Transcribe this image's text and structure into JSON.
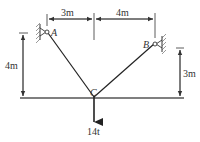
{
  "diagram": {
    "type": "cable-load statics figure",
    "points": {
      "A": {
        "label": "A"
      },
      "B": {
        "label": "B"
      },
      "C": {
        "label": "C"
      }
    },
    "dimensions": {
      "top_left": "3m",
      "top_right": "4m",
      "left_height": "4m",
      "right_height": "3m"
    },
    "load": {
      "label": "14t"
    },
    "colors": {
      "line": "#333333",
      "ground": "#555555"
    }
  }
}
